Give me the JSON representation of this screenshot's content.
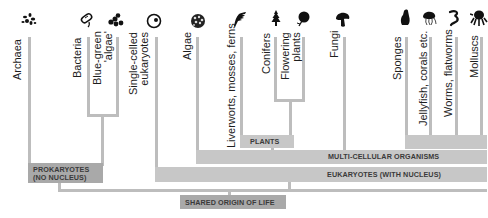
{
  "taxa": [
    {
      "id": "archaea",
      "label": "Archaea",
      "icon": "archaea-icon"
    },
    {
      "id": "bacteria",
      "label": "Bacteria",
      "icon": "bacteria-icon"
    },
    {
      "id": "blue-green",
      "label": "Blue-green\n'algae'",
      "line1": "Blue-green",
      "line2": "'algae'",
      "icon": "cyanobacteria-icon"
    },
    {
      "id": "single-celled",
      "label": "Single-celled eukaryotes",
      "line1": "Single-celled",
      "line2": "eukaryotes",
      "icon": "cell-icon"
    },
    {
      "id": "algae",
      "label": "Algae",
      "icon": "algae-icon"
    },
    {
      "id": "liverworts",
      "label": "Liverworts, mosses, ferns",
      "icon": "fern-icon"
    },
    {
      "id": "conifers",
      "label": "Conifers",
      "icon": "conifer-icon"
    },
    {
      "id": "flowering",
      "label": "Flowering plants",
      "line1": "Flowering",
      "line2": "plants",
      "icon": "flower-icon"
    },
    {
      "id": "fungi",
      "label": "Fungi",
      "icon": "mushroom-icon"
    },
    {
      "id": "sponges",
      "label": "Sponges",
      "icon": "sponge-icon"
    },
    {
      "id": "jellyfish",
      "label": "Jellyfish, corals etc.",
      "icon": "jellyfish-icon"
    },
    {
      "id": "worms",
      "label": "Worms, flatworms",
      "icon": "worm-icon"
    },
    {
      "id": "molluscs",
      "label": "Molluscs",
      "icon": "octopus-icon"
    }
  ],
  "groups": {
    "prokaryotes": {
      "line1": "PROKARYOTES",
      "line2": "(NO NUCLEUS)"
    },
    "plants": "PLANTS",
    "multicellular": "MULTI-CELLULAR ORGANISMS",
    "eukaryotes": "EUKARYOTES (WITH NUCLEUS)",
    "origin": "SHARED ORIGIN OF LIFE"
  },
  "colors": {
    "line": "#bdbdbd",
    "band": "#c7c7c7",
    "band_dark": "#a9a9a9",
    "text": "#1e1e1e"
  }
}
